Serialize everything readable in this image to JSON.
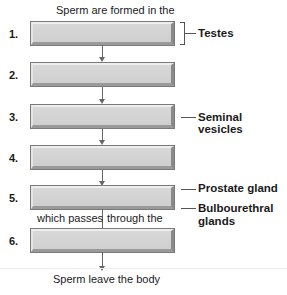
{
  "title_caption": "Sperm are formed in the",
  "steps": [
    {
      "number": "1."
    },
    {
      "number": "2."
    },
    {
      "number": "3."
    },
    {
      "number": "4."
    },
    {
      "number": "5."
    },
    {
      "number": "6."
    }
  ],
  "labels": {
    "testes": "Testes",
    "seminal_vesicles": "Seminal vesicles",
    "prostate_gland": "Prostate gland",
    "bulbourethral_line1": "Bulbourethral",
    "bulbourethral_line2": "glands"
  },
  "connector_text": {
    "left": "which passes",
    "right": "through the"
  },
  "footer_caption": "Sperm leave the body"
}
